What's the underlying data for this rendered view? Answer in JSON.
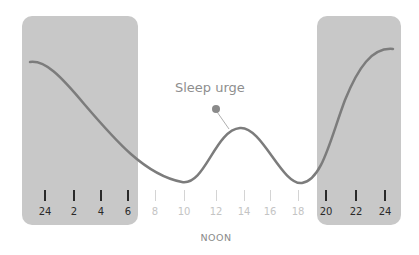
{
  "chart_data": {
    "type": "line",
    "title": "",
    "series": [
      {
        "name": "Sleep urge",
        "x": [
          24,
          2,
          4,
          6,
          8,
          10,
          12,
          14,
          16,
          18,
          20,
          22,
          24
        ],
        "values": [
          0.9,
          0.75,
          0.5,
          0.25,
          0.08,
          0.02,
          0.25,
          0.4,
          0.2,
          0.02,
          0.3,
          0.85,
          0.95
        ]
      }
    ],
    "annotation": "Sleep urge",
    "xlabel": "NOON",
    "shaded_regions": [
      [
        "24",
        "6"
      ],
      [
        "20",
        "24"
      ]
    ]
  },
  "labels": {
    "annotation": "Sleep urge",
    "noon": "NOON"
  },
  "ticks": [
    {
      "label": "24",
      "x": 45,
      "dark": true
    },
    {
      "label": "2",
      "x": 74,
      "dark": true
    },
    {
      "label": "4",
      "x": 101,
      "dark": true
    },
    {
      "label": "6",
      "x": 128,
      "dark": true
    },
    {
      "label": "8",
      "x": 155,
      "dark": false
    },
    {
      "label": "10",
      "x": 184,
      "dark": false
    },
    {
      "label": "12",
      "x": 216,
      "dark": false
    },
    {
      "label": "14",
      "x": 244,
      "dark": false
    },
    {
      "label": "16",
      "x": 270,
      "dark": false
    },
    {
      "label": "18",
      "x": 298,
      "dark": false
    },
    {
      "label": "20",
      "x": 326,
      "dark": true
    },
    {
      "label": "22",
      "x": 356,
      "dark": true
    },
    {
      "label": "24",
      "x": 385,
      "dark": true
    }
  ],
  "colors": {
    "shade": "#c8c8c8",
    "curve": "#7c7c7c",
    "marker": "#8a8a8a"
  }
}
